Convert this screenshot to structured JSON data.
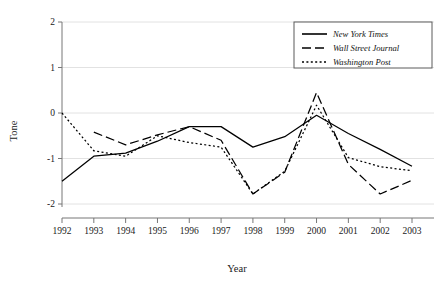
{
  "chart_data": {
    "type": "line",
    "title": "",
    "xlabel": "Year",
    "ylabel": "Tone",
    "categories": [
      "1992",
      "1993",
      "1994",
      "1995",
      "1996",
      "1997",
      "1998",
      "1999",
      "2000",
      "2001",
      "2002",
      "2003"
    ],
    "x": [
      1992,
      1993,
      1994,
      1995,
      1996,
      1997,
      1998,
      1999,
      2000,
      2001,
      2002,
      2003
    ],
    "xlim": [
      1992,
      2003
    ],
    "ylim": [
      -2,
      2
    ],
    "yticks": [
      2,
      1,
      0,
      -1,
      -2
    ],
    "ytick_labels": [
      "2",
      "1",
      "0",
      "-1",
      "-2"
    ],
    "xticks": [
      1992,
      1993,
      1994,
      1995,
      1996,
      1997,
      1998,
      1999,
      2000,
      2001,
      2002,
      2003
    ],
    "grid": true,
    "grid_axis": "y",
    "legend_position": "top-right",
    "series": [
      {
        "name": "New York Times",
        "style": "solid",
        "color": "#000000",
        "values": [
          -1.5,
          -0.95,
          -0.88,
          -0.62,
          -0.3,
          -0.3,
          -0.75,
          -0.52,
          -0.05,
          -0.45,
          -0.8,
          -1.17
        ]
      },
      {
        "name": "Wall Street Journal",
        "style": "dashed",
        "color": "#000000",
        "values": [
          null,
          -0.42,
          -0.7,
          -0.48,
          -0.3,
          -0.6,
          -1.78,
          -1.3,
          0.45,
          -1.13,
          -1.78,
          -1.48
        ]
      },
      {
        "name": "Washington Post",
        "style": "dotted",
        "color": "#000000",
        "values": [
          0.0,
          -0.83,
          -0.95,
          -0.5,
          -0.65,
          -0.75,
          -1.78,
          -1.28,
          0.17,
          -0.98,
          -1.18,
          -1.27
        ]
      }
    ]
  },
  "axes": {
    "y_title": "Tone",
    "x_title": "Year"
  },
  "legend": {
    "entries": [
      {
        "label": "New York Times",
        "style": "solid"
      },
      {
        "label": "Wall Street Journal",
        "style": "dashed"
      },
      {
        "label": "Washington Post",
        "style": "dotted"
      }
    ]
  },
  "colors": {
    "ink": "#000000",
    "axis": "#777777",
    "grid": "#e2e2e2",
    "background": "#ffffff"
  }
}
